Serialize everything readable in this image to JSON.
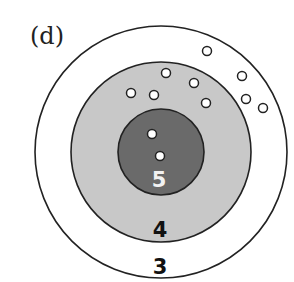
{
  "panel_label": "(d)",
  "center": {
    "x": 161,
    "y": 152
  },
  "rings": [
    {
      "name": "ring-3",
      "label": "3",
      "r": 126,
      "fill": "#ffffff",
      "label_x": 160,
      "label_y": 274,
      "label_color": "#111111"
    },
    {
      "name": "ring-4",
      "label": "4",
      "r": 90,
      "fill": "#c8c8c8",
      "label_x": 160,
      "label_y": 237,
      "label_color": "#111111"
    },
    {
      "name": "ring-5",
      "label": "5",
      "r": 43,
      "fill": "#6a6a6a",
      "label_x": 159,
      "label_y": 187,
      "label_color": "#f2f2f2"
    }
  ],
  "points": [
    {
      "x": 152,
      "y": 134
    },
    {
      "x": 160,
      "y": 156
    },
    {
      "x": 131,
      "y": 93
    },
    {
      "x": 154,
      "y": 95
    },
    {
      "x": 166,
      "y": 73
    },
    {
      "x": 194,
      "y": 83
    },
    {
      "x": 206,
      "y": 103
    },
    {
      "x": 207,
      "y": 51
    },
    {
      "x": 242,
      "y": 76
    },
    {
      "x": 246,
      "y": 99
    },
    {
      "x": 263,
      "y": 108
    }
  ],
  "point_radius": 4.5,
  "stroke_color": "#222222"
}
